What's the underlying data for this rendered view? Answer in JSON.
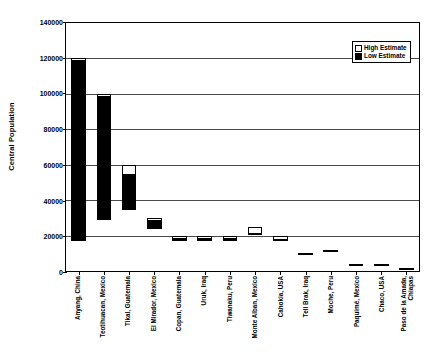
{
  "chart_data": {
    "type": "bar",
    "title": "",
    "xlabel": "",
    "ylabel": "Central Population",
    "ylim": [
      0,
      140000
    ],
    "yticks": [
      0,
      20000,
      40000,
      60000,
      80000,
      100000,
      120000,
      140000
    ],
    "grid": true,
    "legend_position": "top-right",
    "legend": [
      "High Estimate",
      "Low Estimate"
    ],
    "categories": [
      "Anyang, China",
      "Teotihuacan, Mexico",
      "Tikal, Guatemala",
      "El Mirador, Mexico",
      "Copan, Guatemala",
      "Uruk, Iraq",
      "Tiwanaku, Peru",
      "Monte Alban, Mexico",
      "Cahokia, USA",
      "Tell Brak, Iraq",
      "Moche, Peru",
      "Paquimé, Mexico",
      "Chaco, USA",
      "Paso de la Amada, Chiapas"
    ],
    "series": [
      {
        "name": "High Estimate",
        "values": [
          120000,
          100000,
          60000,
          30000,
          20000,
          20000,
          20000,
          25000,
          20000,
          10000,
          12000,
          4000,
          4000,
          1500
        ]
      },
      {
        "name": "Low Estimate",
        "values": [
          120000,
          100000,
          50000,
          30000,
          20000,
          20000,
          16000,
          5000,
          10000,
          10000,
          6000,
          2500,
          2500,
          1200
        ]
      }
    ]
  },
  "axis": {
    "y_title": "Central Population",
    "y_tick_labels": [
      "140000",
      "120000",
      "100000",
      "80000",
      "60000",
      "40000",
      "20000",
      "0"
    ]
  },
  "legend": {
    "items": [
      {
        "label": "High Estimate",
        "swatch": "open-square",
        "color": "#ffffff"
      },
      {
        "label": "Low Estimate",
        "swatch": "filled-square",
        "color": "#000000"
      }
    ]
  },
  "colors": {
    "high_estimate": "#ffffff",
    "low_estimate": "#000000",
    "axis": "#000000",
    "gridline": "#4a4a4a",
    "background": "#ffffff"
  }
}
